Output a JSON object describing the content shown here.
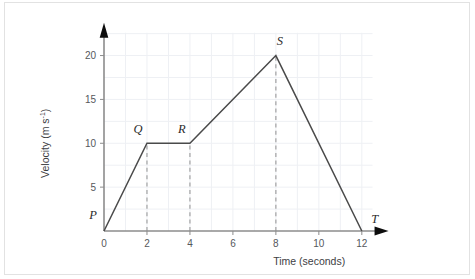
{
  "chart_data": {
    "type": "line",
    "title": "",
    "xlabel": "Time (seconds)",
    "ylabel": "Velocity (m s⁻¹)",
    "ylabel_base": "Velocity  (m s",
    "ylabel_exponent": "-1",
    "ylabel_close": ")",
    "xlim": [
      0,
      12.8
    ],
    "ylim": [
      0,
      22.8
    ],
    "xticks": [
      0,
      2,
      4,
      6,
      8,
      10,
      12
    ],
    "xtick_labels": [
      "0",
      "2",
      "4",
      "6",
      "8",
      "10",
      "12"
    ],
    "yticks": [
      5,
      10,
      15,
      20
    ],
    "ytick_labels": [
      "5",
      "10",
      "15",
      "20"
    ],
    "grid": true,
    "grid_x_step": 1,
    "grid_y_step": 2.5,
    "legend": "none",
    "series": [
      {
        "name": "velocity",
        "x": [
          0,
          2,
          4,
          8,
          12
        ],
        "y": [
          0,
          10,
          10,
          20,
          0
        ]
      }
    ],
    "annotations": [
      {
        "label": "P",
        "x": 0,
        "y": 0,
        "dx": -11,
        "dy": -12
      },
      {
        "label": "Q",
        "x": 2,
        "y": 10,
        "dx": -9,
        "dy": -10
      },
      {
        "label": "R",
        "x": 4,
        "y": 10,
        "dx": -8,
        "dy": -10
      },
      {
        "label": "S",
        "x": 8,
        "y": 20,
        "dx": 4,
        "dy": -11
      },
      {
        "label": "T",
        "x": 12,
        "y": 0,
        "dx": 13,
        "dy": -8
      }
    ],
    "drop_lines": [
      {
        "x": 2,
        "y_top": 10
      },
      {
        "x": 4,
        "y_top": 10
      },
      {
        "x": 8,
        "y_top": 20
      }
    ],
    "colors": {
      "data_line": "#4a4a4a",
      "axis": "#8c8c8c",
      "grid": "#eef0f4",
      "drop_line": "#9a9a9a",
      "frame_border": "#e2e2e2",
      "background": "#ffffff"
    }
  }
}
